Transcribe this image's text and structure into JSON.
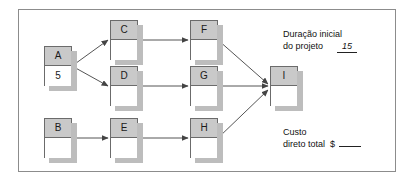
{
  "diagram": {
    "type": "project-network-diagram",
    "nodes": [
      {
        "id": "A",
        "label": "A",
        "value": "5",
        "x": 44,
        "y": 46
      },
      {
        "id": "B",
        "label": "B",
        "value": "",
        "x": 44,
        "y": 118
      },
      {
        "id": "C",
        "label": "C",
        "value": "",
        "x": 110,
        "y": 20
      },
      {
        "id": "D",
        "label": "D",
        "value": "",
        "x": 110,
        "y": 66
      },
      {
        "id": "E",
        "label": "E",
        "value": "",
        "x": 110,
        "y": 118
      },
      {
        "id": "F",
        "label": "F",
        "value": "",
        "x": 190,
        "y": 20
      },
      {
        "id": "G",
        "label": "G",
        "value": "",
        "x": 190,
        "y": 66
      },
      {
        "id": "H",
        "label": "H",
        "value": "",
        "x": 190,
        "y": 118
      },
      {
        "id": "I",
        "label": "I",
        "value": "",
        "x": 270,
        "y": 66
      }
    ],
    "edges": [
      {
        "from": "A",
        "to": "C"
      },
      {
        "from": "A",
        "to": "D"
      },
      {
        "from": "C",
        "to": "F"
      },
      {
        "from": "D",
        "to": "G"
      },
      {
        "from": "B",
        "to": "E"
      },
      {
        "from": "E",
        "to": "H"
      },
      {
        "from": "F",
        "to": "I"
      },
      {
        "from": "G",
        "to": "I"
      },
      {
        "from": "H",
        "to": "I"
      }
    ],
    "colors": {
      "node_header": "#c9c9c9",
      "node_body": "#ffffff",
      "node_border": "#6b6b6b",
      "node_shadow": "#bdbdbd",
      "line": "#555555",
      "panel_border": "#8c8c8c"
    }
  },
  "annotations": {
    "duration": {
      "line1": "Duração inicial",
      "line2": "do projeto",
      "value": "15"
    },
    "cost": {
      "line1": "Custo",
      "line2": "direto total",
      "currency": "$",
      "value": ""
    }
  }
}
